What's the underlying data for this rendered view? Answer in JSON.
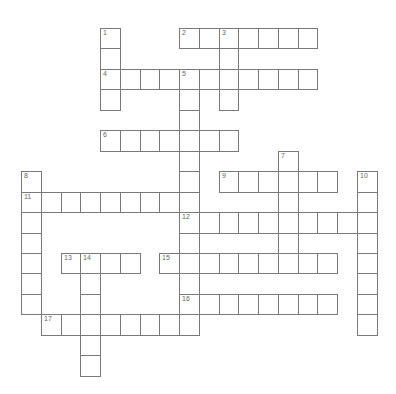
{
  "puzzle": {
    "type": "crossword",
    "words": [
      {
        "number": "1",
        "direction": "down",
        "row": 0,
        "col": 4,
        "length": 4
      },
      {
        "number": "2",
        "direction": "across",
        "row": 0,
        "col": 8,
        "length": 7
      },
      {
        "number": "3",
        "direction": "down",
        "row": 0,
        "col": 10,
        "length": 4
      },
      {
        "number": "4",
        "direction": "across",
        "row": 2,
        "col": 4,
        "length": 11
      },
      {
        "number": "5",
        "direction": "down",
        "row": 2,
        "col": 8,
        "length": 13
      },
      {
        "number": "6",
        "direction": "across",
        "row": 5,
        "col": 4,
        "length": 7
      },
      {
        "number": "7",
        "direction": "down",
        "row": 6,
        "col": 13,
        "length": 6
      },
      {
        "number": "8",
        "direction": "down",
        "row": 7,
        "col": 0,
        "length": 7
      },
      {
        "number": "9",
        "direction": "across",
        "row": 7,
        "col": 10,
        "length": 6
      },
      {
        "number": "10",
        "direction": "down",
        "row": 7,
        "col": 17,
        "length": 8
      },
      {
        "number": "11",
        "direction": "across",
        "row": 8,
        "col": 0,
        "length": 9
      },
      {
        "number": "12",
        "direction": "across",
        "row": 9,
        "col": 8,
        "length": 10
      },
      {
        "number": "13",
        "direction": "across",
        "row": 11,
        "col": 2,
        "length": 4
      },
      {
        "number": "14",
        "direction": "down",
        "row": 11,
        "col": 3,
        "length": 6
      },
      {
        "number": "15",
        "direction": "across",
        "row": 11,
        "col": 7,
        "length": 9
      },
      {
        "number": "16",
        "direction": "across",
        "row": 13,
        "col": 8,
        "length": 8
      },
      {
        "number": "17",
        "direction": "across",
        "row": 14,
        "col": 1,
        "length": 8
      }
    ],
    "colors": {
      "cell_border": "#7a7a7a",
      "cell_fill": "#ffffff",
      "number_text": "#666666"
    }
  }
}
